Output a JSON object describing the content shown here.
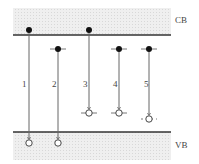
{
  "diagram": {
    "bands": {
      "cb": {
        "label": "CB",
        "x": 13,
        "y": 8,
        "w": 158,
        "h": 27,
        "edge_y": 35
      },
      "vb": {
        "label": "VB",
        "x": 13,
        "y": 132,
        "w": 158,
        "h": 28,
        "edge_y": 132
      }
    },
    "colors": {
      "band_fill": "#ececec",
      "line": "#333333",
      "dot": "#111111",
      "stem": "#666666"
    },
    "transitions": [
      {
        "label": "1",
        "x": 29,
        "start_y": 30,
        "start_tick": false,
        "end_y": 143,
        "end_tick": false,
        "end_dashed": false,
        "arrow": true,
        "label_x": 22
      },
      {
        "label": "2",
        "x": 58,
        "start_y": 49,
        "start_tick": true,
        "end_y": 143,
        "end_tick": false,
        "end_dashed": false,
        "arrow": true,
        "label_x": 52
      },
      {
        "label": "3",
        "x": 89,
        "start_y": 30,
        "start_tick": false,
        "end_y": 113,
        "end_tick": true,
        "end_dashed": false,
        "arrow": true,
        "label_x": 83
      },
      {
        "label": "4",
        "x": 119,
        "start_y": 49,
        "start_tick": true,
        "end_y": 113,
        "end_tick": true,
        "end_dashed": false,
        "arrow": true,
        "label_x": 113
      },
      {
        "label": "5",
        "x": 149,
        "start_y": 49,
        "start_tick": true,
        "end_y": 119,
        "end_tick": true,
        "end_dashed": true,
        "arrow": true,
        "label_x": 144
      }
    ]
  }
}
